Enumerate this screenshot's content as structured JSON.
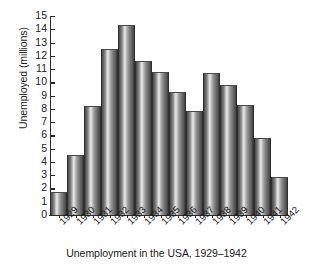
{
  "chart_data": {
    "type": "bar",
    "title": "",
    "caption": "Unemployment in the USA, 1929–1942",
    "xlabel": "",
    "ylabel": "Unemployed (millions)",
    "categories": [
      "1929",
      "1930",
      "1931",
      "1932",
      "1933",
      "1934",
      "1935",
      "1936",
      "1937",
      "1938",
      "1939",
      "1940",
      "1941",
      "1942"
    ],
    "values": [
      1.7,
      4.5,
      8.2,
      12.5,
      14.3,
      11.6,
      10.8,
      9.3,
      7.85,
      10.7,
      9.8,
      8.3,
      5.8,
      2.9
    ],
    "ylim": [
      0,
      15
    ],
    "ytick_labels": [
      "15",
      "14",
      "13",
      "12",
      "11",
      "10",
      "9",
      "8",
      "7",
      "6",
      "5",
      "4",
      "3",
      "2",
      "1",
      "0"
    ],
    "ytick_values": [
      15,
      14,
      13,
      12,
      11,
      10,
      9,
      8,
      7,
      6,
      5,
      4,
      3,
      2,
      1,
      0
    ],
    "grid": false,
    "legend": null,
    "bar_color": "#8a8a8a",
    "axis_color": "#2b2b2b",
    "background_color": "#ffffff"
  }
}
